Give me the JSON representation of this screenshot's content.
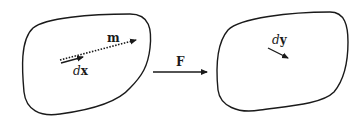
{
  "diagram": {
    "left_region": {
      "vector_m": {
        "label": "m",
        "style": "dotted-arrow"
      },
      "vector_dx": {
        "prefix": "d",
        "symbol": "x",
        "style": "solid-arrow"
      }
    },
    "mapping": {
      "label": "F",
      "style": "solid-arrow"
    },
    "right_region": {
      "vector_dy": {
        "prefix": "d",
        "symbol": "y",
        "style": "solid-arrow"
      }
    },
    "colors": {
      "stroke": "#1a1a1a",
      "background": "#ffffff"
    }
  }
}
